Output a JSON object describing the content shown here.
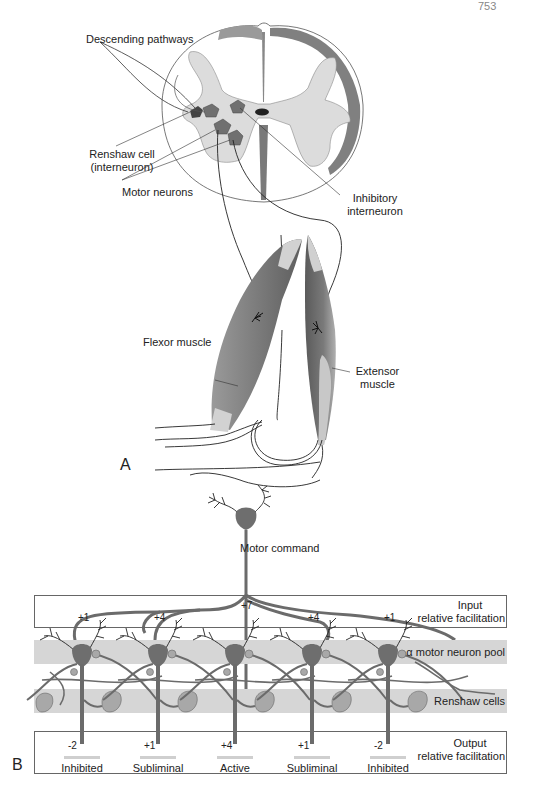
{
  "header": {
    "page_number_fragment": "753"
  },
  "panel_a": {
    "letter": "A",
    "labels": {
      "descending_pathways": "Descending pathways",
      "renshaw_cell_line1": "Renshaw cell",
      "renshaw_cell_line2": "(interneuron)",
      "motor_neurons": "Motor neurons",
      "inhibitory_line1": "Inhibitory",
      "inhibitory_line2": "interneuron",
      "flexor": "Flexor muscle",
      "extensor_line1": "Extensor",
      "extensor_line2": "muscle"
    }
  },
  "panel_b": {
    "letter": "B",
    "motor_command": "Motor command",
    "input_label_line1": "Input",
    "input_label_line2": "relative facilitation",
    "pool_label": "α motor neuron pool",
    "renshaw_label": "Renshaw cells",
    "output_label_line1": "Output",
    "output_label_line2": "relative facilitation",
    "neurons": [
      {
        "input": "+1",
        "output": "-2",
        "state": "Inhibited"
      },
      {
        "input": "+4",
        "output": "+1",
        "state": "Subliminal"
      },
      {
        "input": "+7",
        "output": "+4",
        "state": "Active"
      },
      {
        "input": "+4",
        "output": "+1",
        "state": "Subliminal"
      },
      {
        "input": "+1",
        "output": "-2",
        "state": "Inhibited"
      }
    ]
  },
  "colors": {
    "gray_matter": "#dcdcdc",
    "white_matter_tract": "#7a7a7a",
    "neuron_body": "#6e6e6e",
    "renshaw_body": "#a8a8a8",
    "band": "#d6d6d6",
    "muscle_dark": "#6a6a6a",
    "tendon": "#d8d8d8"
  }
}
